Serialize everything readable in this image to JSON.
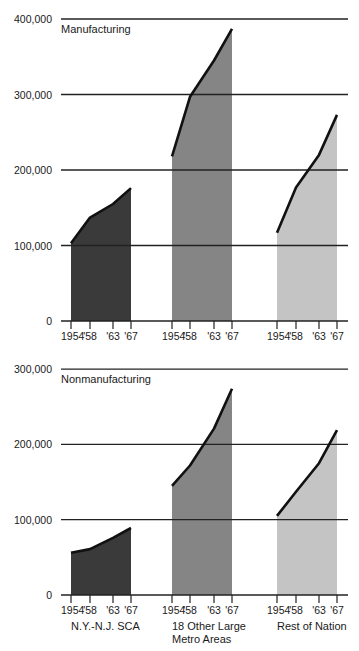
{
  "chart_data": [
    {
      "type": "area",
      "title": "Manufacturing",
      "xlabel": "",
      "ylabel": "",
      "ylim": [
        0,
        400000
      ],
      "yticks": [
        "0",
        "100,000",
        "200,000",
        "300,000",
        "400,000"
      ],
      "grid": true,
      "x": [
        "1954",
        "'58",
        "'63",
        "'67"
      ],
      "series": [
        {
          "name": "N.Y.-N.J. SCA",
          "color": "#3a3a3a",
          "values": [
            103000,
            137000,
            155000,
            176000
          ]
        },
        {
          "name": "18 Other Large Metro Areas",
          "color": "#858585",
          "values": [
            218000,
            297000,
            345000,
            387000
          ]
        },
        {
          "name": "Rest of Nation",
          "color": "#c4c4c4",
          "values": [
            117000,
            177000,
            220000,
            273000
          ]
        }
      ]
    },
    {
      "type": "area",
      "title": "Nonmanufacturing",
      "xlabel": "",
      "ylabel": "",
      "ylim": [
        0,
        300000
      ],
      "yticks": [
        "0",
        "100,000",
        "200,000",
        "300,000"
      ],
      "grid": true,
      "x": [
        "1954",
        "'58",
        "'63",
        "'67"
      ],
      "series": [
        {
          "name": "N.Y.-N.J. SCA",
          "color": "#3a3a3a",
          "values": [
            56000,
            61000,
            76000,
            89000
          ]
        },
        {
          "name": "18 Other Large Metro Areas",
          "color": "#858585",
          "values": [
            145000,
            172000,
            221000,
            274000
          ]
        },
        {
          "name": "Rest of Nation",
          "color": "#c4c4c4",
          "values": [
            105000,
            137000,
            175000,
            219000
          ]
        }
      ]
    }
  ],
  "labels": {
    "top_title": "Manufacturing",
    "bottom_title": "Nonmanufacturing",
    "top_yticks": [
      "400,000",
      "300,000",
      "200,000",
      "100,000",
      "0"
    ],
    "bottom_yticks": [
      "300,000",
      "200,000",
      "100,000",
      "0"
    ],
    "xticks": [
      "1954",
      "'58",
      "'63",
      "'67"
    ],
    "groups": [
      {
        "line1": "N.Y.-N.J. SCA",
        "line2": ""
      },
      {
        "line1": "18 Other Large",
        "line2": "Metro Areas"
      },
      {
        "line1": "Rest of Nation",
        "line2": ""
      }
    ]
  }
}
